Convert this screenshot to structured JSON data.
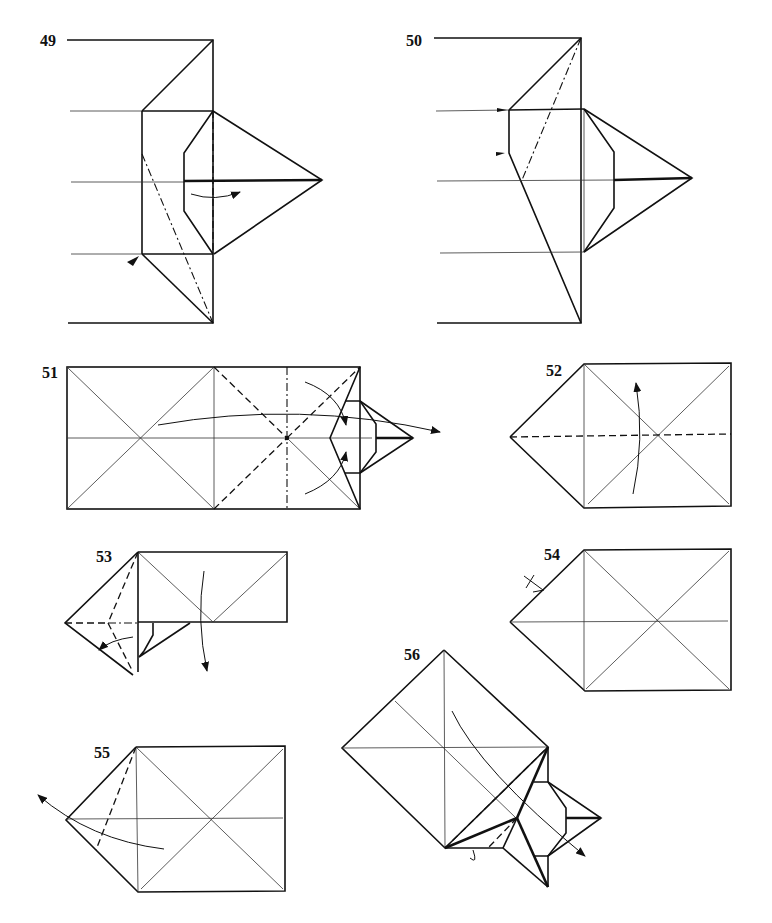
{
  "page": {
    "type": "origami folding diagram sheet",
    "background": "#ffffff",
    "ink": "#111111"
  },
  "steps": [
    {
      "number": "49",
      "description": "Swivel/reverse fold with mountain fold line and curved arrow; inward push arrowhead at lower left corner"
    },
    {
      "number": "50",
      "description": "Result with mountain fold from top-right corner; two push arrowheads on left edge"
    },
    {
      "number": "51",
      "description": "Rectangle with diagonal creases, valley folds, vertical mountain fold, collapse arrows"
    },
    {
      "number": "52",
      "description": "Pentagon shape with horizontal valley fold line and fold-over arrow"
    },
    {
      "number": "53",
      "description": "Folded shape with valley and mountain folds, arrows indicating fold down"
    },
    {
      "number": "54",
      "description": "Pentagon shape with crease pattern; tick mark on upper-left edge"
    },
    {
      "number": "55",
      "description": "Pentagon with valley fold from top corner; arrow leftward"
    },
    {
      "number": "56",
      "description": "Rotated square with attached model point; valley folds and arrow to lower right"
    }
  ]
}
